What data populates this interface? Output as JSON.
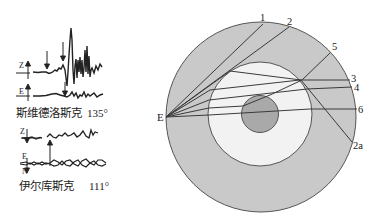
{
  "seismograms": [
    {
      "station": "斯维德洛斯克",
      "distance": "135°",
      "components": [
        "Z",
        "E"
      ]
    },
    {
      "station": "伊尔库斯克",
      "distance": "111°",
      "components": [
        "Z",
        "E",
        "N"
      ]
    }
  ],
  "earth_diagram": {
    "source_label": "E",
    "ray_labels": [
      "1",
      "2",
      "5",
      "3",
      "4",
      "6",
      "2a"
    ],
    "colors": {
      "crust_mantle": "#c9c9c9",
      "outer_core": "#f2f2f2",
      "inner_core": "#a9a9a9",
      "rays": "#3a3a3a",
      "outline": "#555555"
    }
  }
}
